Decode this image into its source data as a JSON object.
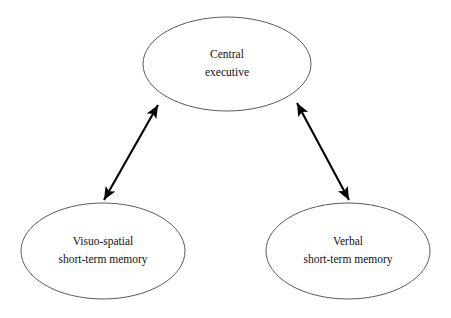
{
  "diagram": {
    "type": "node-link-diagram",
    "background_color": "#ffffff",
    "node_stroke_color": "#5a5a5a",
    "node_fill_color": "#ffffff",
    "connector_color": "#000000",
    "text_color": "#111111",
    "nodes": [
      {
        "id": "central-executive",
        "label_line1": "Central",
        "label_line2": "executive",
        "cx": 227,
        "cy": 64,
        "rx": 84,
        "ry": 47
      },
      {
        "id": "visuo-spatial-short-term-memory",
        "label_line1": "Visuo-spatial",
        "label_line2": "short-term memory",
        "cx": 103,
        "cy": 251,
        "rx": 82,
        "ry": 48
      },
      {
        "id": "verbal-short-term-memory",
        "label_line1": "Verbal",
        "label_line2": "short-term memory",
        "cx": 348,
        "cy": 251,
        "rx": 82,
        "ry": 48
      }
    ],
    "connectors": [
      {
        "id": "central-executive-to-visuo-spatial",
        "from": "central-executive",
        "to": "visuo-spatial-short-term-memory",
        "direction": "bidirectional",
        "x1": 158,
        "y1": 105,
        "x2": 104,
        "y2": 200
      },
      {
        "id": "central-executive-to-verbal",
        "from": "central-executive",
        "to": "verbal-short-term-memory",
        "direction": "bidirectional",
        "x1": 297,
        "y1": 103,
        "x2": 349,
        "y2": 200
      }
    ]
  }
}
